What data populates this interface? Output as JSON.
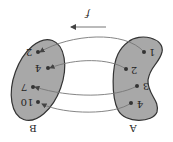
{
  "diagram": {
    "type": "function-mapping",
    "orientation": "rotated-180",
    "function_label": "f",
    "colors": {
      "set_fill": "#a8a8a8",
      "set_stroke": "#333333",
      "arrow": "#555555",
      "curve": "#777777",
      "point": "#333333"
    },
    "domain": {
      "label": "A",
      "elements": [
        "1",
        "2",
        "3",
        "4"
      ]
    },
    "codomain": {
      "label": "B",
      "elements": [
        "2",
        "4",
        "7",
        "10"
      ]
    },
    "mappings": [
      {
        "from": "1",
        "to": "2"
      },
      {
        "from": "2",
        "to": "4"
      },
      {
        "from": "3",
        "to": "7"
      },
      {
        "from": "4",
        "to": "10"
      }
    ]
  }
}
